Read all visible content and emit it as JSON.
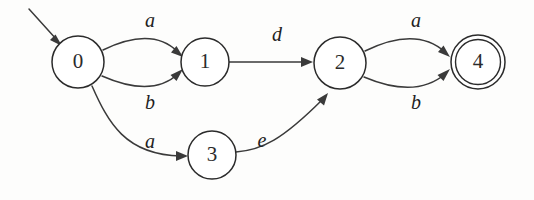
{
  "figure": {
    "kind": "finite-state-automaton-diagram",
    "title": "",
    "background_color": "#fdfdfc",
    "stroke_color": "#2b2b2b",
    "edge_color": "#3a3a3a",
    "label_color": "#1f1f1f"
  },
  "states": [
    {
      "id": "0",
      "label": "0",
      "cx": 78,
      "cy": 62,
      "r": 26,
      "accepting": false,
      "initial": true
    },
    {
      "id": "1",
      "label": "1",
      "cx": 205,
      "cy": 62,
      "r": 24,
      "accepting": false,
      "initial": false
    },
    {
      "id": "2",
      "label": "2",
      "cx": 340,
      "cy": 63,
      "r": 26,
      "accepting": false,
      "initial": false
    },
    {
      "id": "3",
      "label": "3",
      "cx": 212,
      "cy": 155,
      "r": 24,
      "accepting": false,
      "initial": false
    },
    {
      "id": "4",
      "label": "4",
      "cx": 478,
      "cy": 62,
      "r": 27,
      "accepting": true,
      "initial": false
    }
  ],
  "transitions": [
    {
      "from": "0",
      "to": "1",
      "label": "a",
      "label_x": 150,
      "label_y": 22
    },
    {
      "from": "0",
      "to": "1",
      "label": "b",
      "label_x": 150,
      "label_y": 104
    },
    {
      "from": "1",
      "to": "2",
      "label": "d",
      "label_x": 277,
      "label_y": 36
    },
    {
      "from": "0",
      "to": "3",
      "label": "a",
      "label_x": 150,
      "label_y": 143
    },
    {
      "from": "3",
      "to": "2",
      "label": "e",
      "label_x": 262,
      "label_y": 142
    },
    {
      "from": "2",
      "to": "4",
      "label": "a",
      "label_x": 416,
      "label_y": 22
    },
    {
      "from": "2",
      "to": "4",
      "label": "b",
      "label_x": 416,
      "label_y": 104
    }
  ],
  "start_arrow": {
    "name": "start-arrow",
    "from_x": 29,
    "from_y": 9,
    "to_x": 60,
    "to_y": 43
  }
}
